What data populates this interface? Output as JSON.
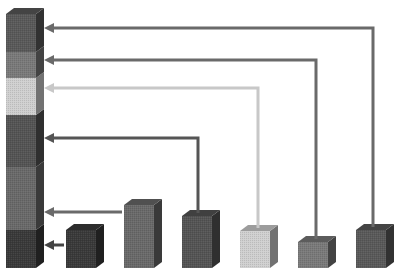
{
  "diagram": {
    "type": "stacked-bar-decomposition",
    "baseline_y": 268,
    "bar_width": 30,
    "depth_x": 8,
    "depth_y": 6,
    "total_bar": {
      "x": 6,
      "segments_bottom_to_top": [
        {
          "id": "s1",
          "value": 38,
          "color": "#3a3a3a"
        },
        {
          "id": "s2",
          "value": 63,
          "color": "#6a6a6a"
        },
        {
          "id": "s3",
          "value": 52,
          "color": "#555555"
        },
        {
          "id": "s4",
          "value": 37,
          "color": "#d0d0d0"
        },
        {
          "id": "s5",
          "value": 26,
          "color": "#7a7a7a"
        },
        {
          "id": "s6",
          "value": 38,
          "color": "#5a5a5a"
        }
      ]
    },
    "bars": [
      {
        "id": "b1",
        "x": 66,
        "value": 38,
        "color": "#3a3a3a",
        "segment": "s1"
      },
      {
        "id": "b2",
        "x": 124,
        "value": 63,
        "color": "#6a6a6a",
        "segment": "s2"
      },
      {
        "id": "b3",
        "x": 182,
        "value": 52,
        "color": "#555555",
        "segment": "s3"
      },
      {
        "id": "b4",
        "x": 240,
        "value": 37,
        "color": "#d0d0d0",
        "segment": "s4"
      },
      {
        "id": "b5",
        "x": 298,
        "value": 26,
        "color": "#7a7a7a",
        "segment": "s5"
      },
      {
        "id": "b6",
        "x": 356,
        "value": 38,
        "color": "#5a5a5a",
        "segment": "s6"
      }
    ],
    "arrows": [
      {
        "from_bar": "b6",
        "y": 28,
        "x_turn": 373,
        "color": "#6a6a6a"
      },
      {
        "from_bar": "b5",
        "y": 60,
        "x_turn": 316,
        "color": "#6a6a6a"
      },
      {
        "from_bar": "b4",
        "y": 88,
        "x_turn": 258,
        "color": "#c8c8c8"
      },
      {
        "from_bar": "b3",
        "y": 138,
        "x_turn": 198,
        "color": "#555555"
      },
      {
        "from_bar": "b2",
        "y": 212,
        "x_end": 122,
        "color": "#6a6a6a"
      },
      {
        "from_bar": "b1",
        "y": 245,
        "x_end": 64,
        "color": "#444444"
      }
    ],
    "arrow_head_x": 44
  }
}
